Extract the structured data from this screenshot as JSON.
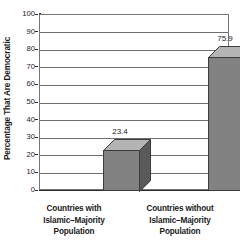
{
  "chart_data": {
    "type": "bar",
    "title": "",
    "subtitle": "",
    "xlabel": "",
    "ylabel": "Percentage That Are Democratic",
    "categories": [
      "Countries with\nIslamic–Majority\nPopulation",
      "Countries without\nIslamic–Majority\nPopulation"
    ],
    "category_lines": [
      [
        "Countries with",
        "Islamic–Majority",
        "Population"
      ],
      [
        "Countries without",
        "Islamic–Majority",
        "Population"
      ]
    ],
    "values": [
      23.4,
      75.9
    ],
    "value_labels": [
      "23.4",
      "75.9"
    ],
    "ylim": [
      0,
      100
    ],
    "ytick_step": 10,
    "yticks": [
      100,
      90,
      80,
      70,
      60,
      50,
      40,
      30,
      20,
      10,
      0
    ],
    "ytick_labels": [
      "100",
      "90",
      "80",
      "70",
      "60",
      "50",
      "40",
      "30",
      "20",
      "10",
      "0"
    ],
    "grid": true,
    "grid_axis": "y",
    "legend": false,
    "legend_position": "none",
    "bar_style": "3d",
    "colors": {
      "bar_front": "#828282",
      "bar_top": "#b4b4b4",
      "bar_side": "#5a5a5a",
      "bar_outline": "#3c3c3c",
      "gridline": "#6e6e6e",
      "axis": "#2b2b2b",
      "frame": "#777777",
      "text": "#1a1a1a",
      "background": "#ffffff"
    }
  }
}
